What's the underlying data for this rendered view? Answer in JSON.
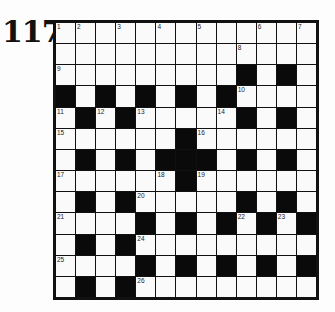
{
  "puzzle": {
    "number_label": "117",
    "rows": 13,
    "cols": 13,
    "grid": [
      ".............",
      ".............",
      ".........#.#.",
      "#.#.#.#.#....",
      ".#.#.....#.#.",
      "......#......",
      ".#.#.###.#.#.",
      "......#......",
      ".#.#.....#.#.",
      "....#.#.#.##.#",
      ".#.#.........",
      "....#.#.#.#.#",
      ".#.#........."
    ],
    "numbers": [
      {
        "r": 0,
        "c": 0,
        "n": "1"
      },
      {
        "r": 0,
        "c": 1,
        "n": "2"
      },
      {
        "r": 0,
        "c": 3,
        "n": "3"
      },
      {
        "r": 0,
        "c": 5,
        "n": "4"
      },
      {
        "r": 0,
        "c": 7,
        "n": "5"
      },
      {
        "r": 0,
        "c": 10,
        "n": "6"
      },
      {
        "r": 0,
        "c": 12,
        "n": "7"
      },
      {
        "r": 1,
        "c": 9,
        "n": "8"
      },
      {
        "r": 2,
        "c": 0,
        "n": "9"
      },
      {
        "r": 3,
        "c": 9,
        "n": "10"
      },
      {
        "r": 4,
        "c": 0,
        "n": "11"
      },
      {
        "r": 4,
        "c": 2,
        "n": "12"
      },
      {
        "r": 4,
        "c": 4,
        "n": "13"
      },
      {
        "r": 4,
        "c": 8,
        "n": "14"
      },
      {
        "r": 5,
        "c": 0,
        "n": "15"
      },
      {
        "r": 5,
        "c": 7,
        "n": "16"
      },
      {
        "r": 7,
        "c": 0,
        "n": "17"
      },
      {
        "r": 7,
        "c": 5,
        "n": "18"
      },
      {
        "r": 7,
        "c": 7,
        "n": "19"
      },
      {
        "r": 8,
        "c": 4,
        "n": "20"
      },
      {
        "r": 9,
        "c": 0,
        "n": "21"
      },
      {
        "r": 9,
        "c": 9,
        "n": "22"
      },
      {
        "r": 9,
        "c": 11,
        "n": "23"
      },
      {
        "r": 10,
        "c": 4,
        "n": "24"
      },
      {
        "r": 11,
        "c": 0,
        "n": "25"
      },
      {
        "r": 12,
        "c": 4,
        "n": "26"
      }
    ]
  }
}
